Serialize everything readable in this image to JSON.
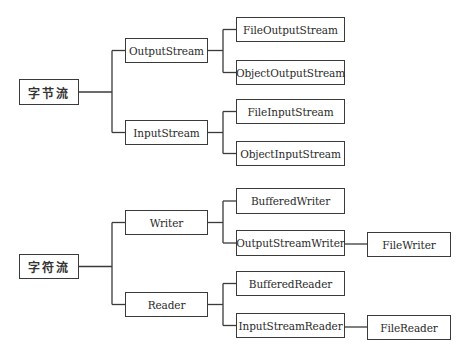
{
  "diagram": {
    "line_color": "#3a3a3a",
    "nodes": [
      {
        "id": "byte_stream",
        "label": "字节流",
        "x": 19,
        "y": 79,
        "w": 60,
        "h": 26
      },
      {
        "id": "output_stream",
        "label": "OutputStream",
        "x": 125,
        "y": 38,
        "w": 83,
        "h": 25
      },
      {
        "id": "file_output_stream",
        "label": "FileOutputStream",
        "x": 236,
        "y": 17,
        "w": 109,
        "h": 25
      },
      {
        "id": "object_output_stream",
        "label": "ObjectOutputStream",
        "x": 236,
        "y": 60,
        "w": 109,
        "h": 25
      },
      {
        "id": "input_stream",
        "label": "InputStream",
        "x": 125,
        "y": 120,
        "w": 83,
        "h": 25
      },
      {
        "id": "file_input_stream",
        "label": "FileInputStream",
        "x": 236,
        "y": 99,
        "w": 109,
        "h": 25
      },
      {
        "id": "object_input_stream",
        "label": "ObjectInputStream",
        "x": 236,
        "y": 141,
        "w": 109,
        "h": 25
      },
      {
        "id": "char_stream",
        "label": "字符流",
        "x": 19,
        "y": 254,
        "w": 60,
        "h": 25
      },
      {
        "id": "writer",
        "label": "Writer",
        "x": 125,
        "y": 210,
        "w": 83,
        "h": 25
      },
      {
        "id": "buffered_writer",
        "label": "BufferedWriter",
        "x": 236,
        "y": 188,
        "w": 109,
        "h": 26
      },
      {
        "id": "output_stream_writer",
        "label": "OutputStreamWriter",
        "x": 236,
        "y": 230,
        "w": 109,
        "h": 26
      },
      {
        "id": "file_writer",
        "label": "FileWriter",
        "x": 367,
        "y": 232,
        "w": 84,
        "h": 25
      },
      {
        "id": "reader",
        "label": "Reader",
        "x": 125,
        "y": 292,
        "w": 83,
        "h": 25
      },
      {
        "id": "buffered_reader",
        "label": "BufferedReader",
        "x": 236,
        "y": 271,
        "w": 109,
        "h": 25
      },
      {
        "id": "input_stream_reader",
        "label": "InputStreamReader",
        "x": 236,
        "y": 313,
        "w": 109,
        "h": 25
      },
      {
        "id": "file_reader",
        "label": "FileReader",
        "x": 367,
        "y": 315,
        "w": 84,
        "h": 25
      }
    ],
    "edges": [
      {
        "from": "byte_stream",
        "to": "output_stream"
      },
      {
        "from": "byte_stream",
        "to": "input_stream"
      },
      {
        "from": "output_stream",
        "to": "file_output_stream"
      },
      {
        "from": "output_stream",
        "to": "object_output_stream"
      },
      {
        "from": "input_stream",
        "to": "file_input_stream"
      },
      {
        "from": "input_stream",
        "to": "object_input_stream"
      },
      {
        "from": "char_stream",
        "to": "writer"
      },
      {
        "from": "char_stream",
        "to": "reader"
      },
      {
        "from": "writer",
        "to": "buffered_writer"
      },
      {
        "from": "writer",
        "to": "output_stream_writer"
      },
      {
        "from": "output_stream_writer",
        "to": "file_writer"
      },
      {
        "from": "reader",
        "to": "buffered_reader"
      },
      {
        "from": "reader",
        "to": "input_stream_reader"
      },
      {
        "from": "input_stream_reader",
        "to": "file_reader"
      }
    ]
  },
  "labels": {
    "byte_stream": "字节流",
    "output_stream": "OutputStream",
    "file_output_stream": "FileOutputStream",
    "object_output_stream": "ObjectOutputStream",
    "input_stream": "InputStream",
    "file_input_stream": "FileInputStream",
    "object_input_stream": "ObjectInputStream",
    "char_stream": "字符流",
    "writer": "Writer",
    "buffered_writer": "BufferedWriter",
    "output_stream_writer": "OutputStreamWriter",
    "file_writer": "FileWriter",
    "reader": "Reader",
    "buffered_reader": "BufferedReader",
    "input_stream_reader": "InputStreamReader",
    "file_reader": "FileReader"
  }
}
